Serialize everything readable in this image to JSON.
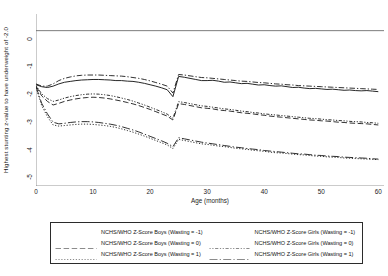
{
  "chart_data": {
    "type": "line",
    "title": "",
    "xlabel": "Age (months)",
    "ylabel": "Highest stunting z-value to have underweight of -2.0",
    "xlim": [
      0,
      61
    ],
    "ylim": [
      -5.6,
      0.6
    ],
    "xticks": [
      0,
      10,
      20,
      30,
      40,
      50,
      60
    ],
    "yticks": [
      0,
      -1,
      -2,
      -3,
      -4,
      -5
    ],
    "xtick_labels": [
      "0",
      "10",
      "20",
      "30",
      "40",
      "50",
      "60"
    ],
    "ytick_labels": [
      "0",
      "-1",
      "-2",
      "-3",
      "-4",
      "-5"
    ],
    "grid": false,
    "reference_lines": [
      {
        "name": "zero-line",
        "axis": "y",
        "value": 0
      }
    ],
    "discontinuity_at_x": 24,
    "legend_position": "below",
    "x": [
      0,
      1,
      2,
      3,
      4,
      5,
      6,
      7,
      8,
      9,
      10,
      11,
      12,
      13,
      14,
      15,
      16,
      17,
      18,
      19,
      20,
      21,
      22,
      23,
      24,
      25,
      26,
      27,
      28,
      29,
      30,
      31,
      32,
      33,
      34,
      35,
      36,
      37,
      38,
      39,
      40,
      41,
      42,
      43,
      44,
      45,
      46,
      47,
      48,
      49,
      50,
      51,
      52,
      53,
      54,
      55,
      56,
      57,
      58,
      59,
      60
    ],
    "series": [
      {
        "name": "NCHS/WHO Z-Score Boys (Wasting = -1)",
        "style": "solid",
        "color": "#1a1a1a",
        "values": [
          -1.95,
          -2.02,
          -2.05,
          -2.0,
          -1.92,
          -1.86,
          -1.83,
          -1.8,
          -1.78,
          -1.77,
          -1.76,
          -1.76,
          -1.77,
          -1.78,
          -1.8,
          -1.8,
          -1.82,
          -1.83,
          -1.86,
          -1.9,
          -1.95,
          -2.0,
          -2.06,
          -2.13,
          -2.38,
          -1.65,
          -1.68,
          -1.72,
          -1.76,
          -1.8,
          -1.8,
          -1.79,
          -1.82,
          -1.86,
          -1.85,
          -1.88,
          -1.91,
          -1.9,
          -1.93,
          -1.96,
          -1.95,
          -1.98,
          -2.0,
          -1.99,
          -2.02,
          -2.05,
          -2.04,
          -2.07,
          -2.09,
          -2.08,
          -2.1,
          -2.12,
          -2.11,
          -2.13,
          -2.15,
          -2.14,
          -2.16,
          -2.17,
          -2.16,
          -2.18,
          -2.2
        ]
      },
      {
        "name": "NCHS/WHO Z-Score Boys (Wasting = 0)",
        "style": "dashed",
        "color": "#1a1a1a",
        "values": [
          -2.0,
          -2.35,
          -2.55,
          -2.68,
          -2.62,
          -2.55,
          -2.5,
          -2.46,
          -2.43,
          -2.41,
          -2.4,
          -2.41,
          -2.43,
          -2.46,
          -2.5,
          -2.54,
          -2.59,
          -2.64,
          -2.7,
          -2.77,
          -2.84,
          -2.92,
          -3.0,
          -3.08,
          -3.22,
          -2.63,
          -2.66,
          -2.7,
          -2.74,
          -2.78,
          -2.8,
          -2.82,
          -2.86,
          -2.88,
          -2.9,
          -2.93,
          -2.96,
          -2.98,
          -3.0,
          -3.03,
          -3.05,
          -3.08,
          -3.1,
          -3.12,
          -3.14,
          -3.16,
          -3.18,
          -3.2,
          -3.22,
          -3.23,
          -3.25,
          -3.26,
          -3.28,
          -3.3,
          -3.31,
          -3.33,
          -3.34,
          -3.35,
          -3.36,
          -3.38,
          -3.4
        ]
      },
      {
        "name": "NCHS/WHO Z-Score Boys (Wasting = 1)",
        "style": "dotted",
        "color": "#1a1a1a",
        "values": [
          -2.05,
          -2.7,
          -3.1,
          -3.4,
          -3.44,
          -3.42,
          -3.4,
          -3.38,
          -3.37,
          -3.37,
          -3.38,
          -3.4,
          -3.42,
          -3.45,
          -3.49,
          -3.54,
          -3.6,
          -3.66,
          -3.73,
          -3.8,
          -3.88,
          -3.96,
          -4.04,
          -4.12,
          -4.25,
          -3.92,
          -3.96,
          -4.0,
          -4.04,
          -4.08,
          -4.1,
          -4.13,
          -4.16,
          -4.18,
          -4.21,
          -4.24,
          -4.26,
          -4.28,
          -4.31,
          -4.33,
          -4.35,
          -4.38,
          -4.4,
          -4.41,
          -4.43,
          -4.45,
          -4.47,
          -4.48,
          -4.5,
          -4.52,
          -4.53,
          -4.55,
          -4.56,
          -4.57,
          -4.59,
          -4.6,
          -4.61,
          -4.62,
          -4.63,
          -4.64,
          -4.65
        ]
      },
      {
        "name": "NCHS/WHO Z-Score Girls (Wasting = -1)",
        "style": "dashdot",
        "color": "#1a1a1a",
        "values": [
          -1.92,
          -2.0,
          -2.0,
          -1.92,
          -1.8,
          -1.72,
          -1.67,
          -1.63,
          -1.61,
          -1.6,
          -1.6,
          -1.6,
          -1.61,
          -1.62,
          -1.63,
          -1.64,
          -1.66,
          -1.69,
          -1.72,
          -1.76,
          -1.81,
          -1.87,
          -1.93,
          -2.0,
          -2.25,
          -1.58,
          -1.6,
          -1.63,
          -1.66,
          -1.69,
          -1.7,
          -1.72,
          -1.74,
          -1.76,
          -1.78,
          -1.8,
          -1.82,
          -1.83,
          -1.85,
          -1.87,
          -1.88,
          -1.9,
          -1.92,
          -1.93,
          -1.95,
          -1.96,
          -1.98,
          -1.99,
          -2.0,
          -2.01,
          -2.02,
          -2.03,
          -2.04,
          -2.05,
          -2.06,
          -2.07,
          -2.08,
          -2.09,
          -2.1,
          -2.11,
          -2.12
        ]
      },
      {
        "name": "NCHS/WHO Z-Score Girls (Wasting = 0)",
        "style": "densedashdot",
        "color": "#1a1a1a",
        "values": [
          -1.98,
          -2.28,
          -2.45,
          -2.55,
          -2.5,
          -2.43,
          -2.38,
          -2.34,
          -2.31,
          -2.29,
          -2.28,
          -2.29,
          -2.31,
          -2.34,
          -2.38,
          -2.43,
          -2.48,
          -2.54,
          -2.61,
          -2.68,
          -2.76,
          -2.84,
          -2.92,
          -3.01,
          -3.16,
          -2.56,
          -2.59,
          -2.63,
          -2.67,
          -2.71,
          -2.73,
          -2.76,
          -2.79,
          -2.82,
          -2.84,
          -2.87,
          -2.9,
          -2.92,
          -2.95,
          -2.97,
          -3.0,
          -3.02,
          -3.04,
          -3.06,
          -3.08,
          -3.1,
          -3.12,
          -3.14,
          -3.16,
          -3.17,
          -3.19,
          -3.21,
          -3.22,
          -3.24,
          -3.25,
          -3.27,
          -3.28,
          -3.29,
          -3.31,
          -3.32,
          -3.34
        ]
      },
      {
        "name": "NCHS/WHO Z-Score Girls (Wasting = 1)",
        "style": "longdashdot",
        "color": "#1a1a1a",
        "values": [
          -2.02,
          -2.62,
          -3.0,
          -3.3,
          -3.36,
          -3.34,
          -3.31,
          -3.29,
          -3.28,
          -3.28,
          -3.29,
          -3.31,
          -3.34,
          -3.37,
          -3.41,
          -3.46,
          -3.52,
          -3.58,
          -3.65,
          -3.73,
          -3.81,
          -3.89,
          -3.97,
          -4.06,
          -4.18,
          -3.86,
          -3.9,
          -3.94,
          -3.98,
          -4.02,
          -4.05,
          -4.08,
          -4.11,
          -4.14,
          -4.17,
          -4.2,
          -4.22,
          -4.25,
          -4.27,
          -4.29,
          -4.32,
          -4.34,
          -4.36,
          -4.38,
          -4.4,
          -4.42,
          -4.44,
          -4.45,
          -4.47,
          -4.49,
          -4.5,
          -4.52,
          -4.53,
          -4.54,
          -4.56,
          -4.57,
          -4.58,
          -4.59,
          -4.6,
          -4.62,
          -4.63
        ]
      }
    ],
    "legend": [
      {
        "label": "NCHS/WHO Z-Score Boys (Wasting = -1)",
        "style": "solid"
      },
      {
        "label": "NCHS/WHO Z-Score Girls (Wasting = -1)",
        "style": "dashdot"
      },
      {
        "label": "NCHS/WHO Z-Score Boys (Wasting = 0)",
        "style": "dashed"
      },
      {
        "label": "NCHS/WHO Z-Score Girls (Wasting = 0)",
        "style": "densedashdot"
      },
      {
        "label": "NCHS/WHO Z-Score Boys (Wasting = 1)",
        "style": "dotted"
      },
      {
        "label": "NCHS/WHO Z-Score Girls (Wasting = 1)",
        "style": "longdashdot"
      }
    ]
  }
}
